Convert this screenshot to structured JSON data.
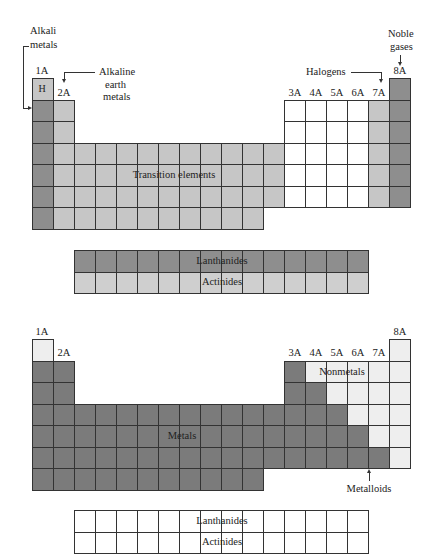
{
  "colors": {
    "alkali": "#8e8e8e",
    "hydrogen": "#c6c6c6",
    "alkaline_earth": "#c6c6c6",
    "transition": "#c6c6c6",
    "main_group_unclassified": "#ffffff",
    "halogen": "#c6c6c6",
    "noble_gas": "#8e8e8e",
    "lanthanide_top": "#8e8e8e",
    "actinide_top": "#cfcfcf",
    "metal": "#7b7b7b",
    "nonmetal": "#eeeeee",
    "fblock_bottom": "#ffffff"
  },
  "top_diagram": {
    "group_labels": {
      "g1": "1A",
      "g2": "2A",
      "g13": "3A",
      "g14": "4A",
      "g15": "5A",
      "g16": "6A",
      "g17": "7A",
      "g18": "8A"
    },
    "hydrogen_symbol": "H",
    "annotations": {
      "alkali_line1": "Alkali",
      "alkali_line2": "metals",
      "alkaline_line1": "Alkaline",
      "alkaline_line2": "earth",
      "alkaline_line3": "metals",
      "halogens": "Halogens",
      "noble_line1": "Noble",
      "noble_line2": "gases",
      "transition": "Transition elements",
      "lanthanides": "Lanthanides",
      "actinides": "Actinides"
    }
  },
  "bottom_diagram": {
    "group_labels": {
      "g1": "1A",
      "g2": "2A",
      "g13": "3A",
      "g14": "4A",
      "g15": "5A",
      "g16": "6A",
      "g17": "7A",
      "g18": "8A"
    },
    "annotations": {
      "nonmetals": "Nonmetals",
      "metals": "Metals",
      "metalloids": "Metalloids",
      "lanthanides": "Lanthanides",
      "actinides": "Actinides"
    }
  }
}
